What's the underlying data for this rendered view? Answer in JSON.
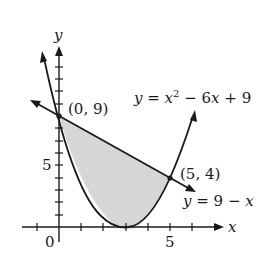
{
  "diagram": {
    "axis_labels": {
      "x": "x",
      "y": "y"
    },
    "tick_labels": {
      "origin": "0",
      "x5": "5",
      "y5": "5"
    },
    "points": [
      {
        "label": "(0, 9)",
        "x": 0,
        "y": 9
      },
      {
        "label": "(5, 4)",
        "x": 5,
        "y": 4
      }
    ],
    "curves": [
      {
        "name": "parabola",
        "label": "y = x² − 6x + 9",
        "label_parts": [
          "y",
          " = ",
          "x",
          "2",
          " − 6",
          "x",
          " + 9"
        ]
      },
      {
        "name": "line",
        "label": "y = 9 − x",
        "label_parts": [
          "y",
          " = 9 − ",
          "x"
        ]
      }
    ],
    "shaded_region": "between line y = 9 − x and parabola y = x² − 6x + 9 from x = 0 to x = 5",
    "colors": {
      "stroke": "#1a1a1a",
      "fill": "#d9d9d9"
    }
  }
}
